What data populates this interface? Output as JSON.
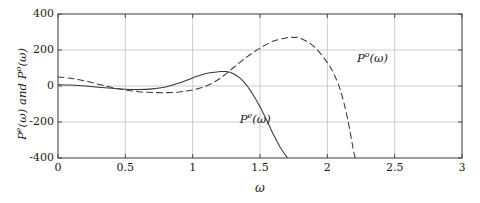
{
  "chart_data": {
    "type": "line",
    "title": "",
    "xlabel": "ω",
    "ylabel": "Pᵉ(ω) and Pᵒ(ω)",
    "xlim": [
      0,
      3
    ],
    "ylim": [
      -400,
      400
    ],
    "xticks": [
      "0",
      "0.5",
      "1",
      "1.5",
      "2",
      "2.5",
      "3"
    ],
    "xtick_values": [
      0,
      0.5,
      1,
      1.5,
      2,
      2.5,
      3
    ],
    "yticks": [
      "400",
      "200",
      "0",
      "-200",
      "-400"
    ],
    "ytick_values": [
      400,
      200,
      0,
      -200,
      -400
    ],
    "grid": true,
    "legend_position": "inline-annotations",
    "series": [
      {
        "name": "P^e(omega)",
        "label_base": "P",
        "label_sup": "e",
        "label_arg": "(ω)",
        "style": "solid",
        "color": "#3a3a3a",
        "annotation_x": 1.35,
        "annotation_y": -190,
        "x": [
          0.0,
          0.1,
          0.2,
          0.3,
          0.4,
          0.5,
          0.6,
          0.7,
          0.8,
          0.9,
          1.0,
          1.1,
          1.2,
          1.25,
          1.3,
          1.35,
          1.4,
          1.45,
          1.5,
          1.55,
          1.6,
          1.65,
          1.7,
          1.72
        ],
        "y": [
          8,
          5,
          0,
          -7,
          -13,
          -18,
          -20,
          -16,
          -5,
          16,
          45,
          70,
          80,
          80,
          70,
          45,
          5,
          -50,
          -115,
          -190,
          -270,
          -340,
          -395,
          -410
        ]
      },
      {
        "name": "P^o(omega)",
        "label_base": "P",
        "label_sup": "o",
        "label_arg": "(ω)",
        "style": "dashed",
        "color": "#3a3a3a",
        "annotation_x": 2.22,
        "annotation_y": 150,
        "x": [
          0.0,
          0.1,
          0.2,
          0.3,
          0.4,
          0.5,
          0.6,
          0.7,
          0.8,
          0.9,
          1.0,
          1.1,
          1.2,
          1.3,
          1.4,
          1.5,
          1.6,
          1.7,
          1.75,
          1.8,
          1.9,
          2.0,
          2.05,
          2.1,
          2.15,
          2.2,
          2.22
        ],
        "y": [
          50,
          42,
          28,
          10,
          -8,
          -22,
          -32,
          -36,
          -37,
          -33,
          -22,
          0,
          40,
          100,
          160,
          210,
          250,
          268,
          270,
          265,
          220,
          130,
          65,
          -30,
          -180,
          -380,
          -410
        ]
      }
    ]
  },
  "axis": {
    "x_title": "ω",
    "y_title_part1_base": "P",
    "y_title_part1_sup": "e",
    "y_title_part1_arg": "(ω)",
    "y_title_conj": " and ",
    "y_title_part2_base": "P",
    "y_title_part2_sup": "o",
    "y_title_part2_arg": "(ω)"
  },
  "colors": {
    "axis": "#4a4a4a",
    "grid": "#b8b8b8",
    "curve": "#3a3a3a",
    "text": "#1a1a1a",
    "background": "#ffffff"
  }
}
